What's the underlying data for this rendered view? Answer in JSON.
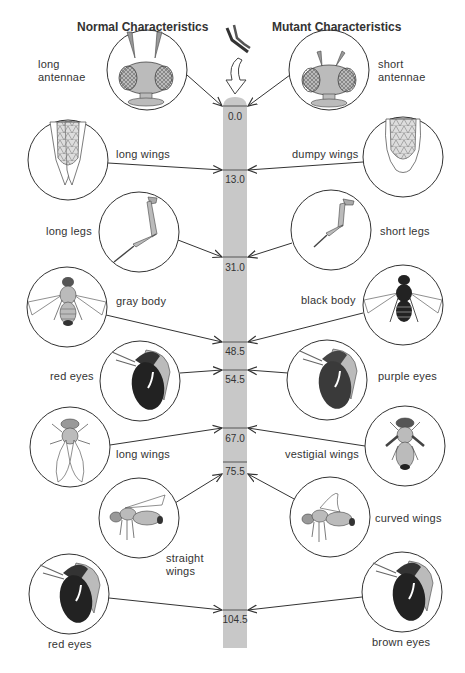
{
  "headers": {
    "normal": "Normal Characteristics",
    "mutant": "Mutant Characteristics"
  },
  "chromosome": {
    "color": "#c8c8c8",
    "loci": [
      {
        "position": "0.0",
        "normal": "long antennae",
        "mutant": "short antennae"
      },
      {
        "position": "13.0",
        "normal": "long wings",
        "mutant": "dumpy wings"
      },
      {
        "position": "31.0",
        "normal": "long legs",
        "mutant": "short legs"
      },
      {
        "position": "48.5",
        "normal": "gray body",
        "mutant": "black body"
      },
      {
        "position": "54.5",
        "normal": "red eyes",
        "mutant": "purple eyes"
      },
      {
        "position": "67.0",
        "normal": "long wings",
        "mutant": "vestigial wings"
      },
      {
        "position": "75.5",
        "normal": "straight wings",
        "mutant": "curved wings"
      },
      {
        "position": "104.5",
        "normal": "red eyes",
        "mutant": "brown eyes"
      }
    ]
  },
  "labels": {
    "l1a": "long",
    "l1b": "antennae",
    "r1a": "short",
    "r1b": "antennae",
    "l2": "long wings",
    "r2": "dumpy wings",
    "l3": "long legs",
    "r3": "short legs",
    "l4": "gray body",
    "r4": "black body",
    "l5": "red eyes",
    "r5": "purple eyes",
    "l6": "long wings",
    "r6": "vestigial wings",
    "l7a": "straight",
    "l7b": "wings",
    "r7": "curved wings",
    "l8": "red eyes",
    "r8": "brown eyes"
  }
}
